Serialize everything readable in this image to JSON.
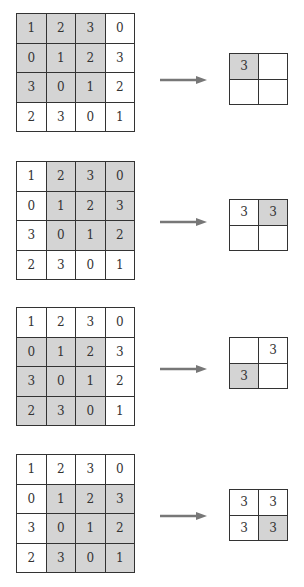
{
  "diagram": {
    "title": "",
    "colors": {
      "highlight": "#d4d4d4",
      "border": "#333333",
      "arrow": "#777777"
    },
    "input": [
      [
        "1",
        "2",
        "3",
        "0"
      ],
      [
        "0",
        "1",
        "2",
        "3"
      ],
      [
        "3",
        "0",
        "1",
        "2"
      ],
      [
        "2",
        "3",
        "0",
        "1"
      ]
    ],
    "steps": [
      {
        "top": 13,
        "out_top": 53,
        "arrow_top": 76,
        "highlight": [
          [
            0,
            0
          ],
          [
            0,
            1
          ],
          [
            0,
            2
          ],
          [
            1,
            0
          ],
          [
            1,
            1
          ],
          [
            1,
            2
          ],
          [
            2,
            0
          ],
          [
            2,
            1
          ],
          [
            2,
            2
          ]
        ],
        "output": [
          [
            "3",
            ""
          ],
          [
            "",
            ""
          ]
        ],
        "output_highlight": [
          [
            0,
            0
          ]
        ]
      },
      {
        "top": 161,
        "out_top": 199,
        "arrow_top": 218,
        "highlight": [
          [
            0,
            1
          ],
          [
            0,
            2
          ],
          [
            0,
            3
          ],
          [
            1,
            1
          ],
          [
            1,
            2
          ],
          [
            1,
            3
          ],
          [
            2,
            1
          ],
          [
            2,
            2
          ],
          [
            2,
            3
          ]
        ],
        "output": [
          [
            "3",
            "3"
          ],
          [
            "",
            ""
          ]
        ],
        "output_highlight": [
          [
            0,
            1
          ]
        ]
      },
      {
        "top": 307,
        "out_top": 337,
        "arrow_top": 365,
        "highlight": [
          [
            1,
            0
          ],
          [
            1,
            1
          ],
          [
            1,
            2
          ],
          [
            2,
            0
          ],
          [
            2,
            1
          ],
          [
            2,
            2
          ],
          [
            3,
            0
          ],
          [
            3,
            1
          ],
          [
            3,
            2
          ]
        ],
        "output": [
          [
            "",
            "3"
          ],
          [
            "3",
            ""
          ]
        ],
        "output_highlight": [
          [
            1,
            0
          ]
        ]
      },
      {
        "top": 454,
        "out_top": 489,
        "arrow_top": 512,
        "highlight": [
          [
            1,
            1
          ],
          [
            1,
            2
          ],
          [
            1,
            3
          ],
          [
            2,
            1
          ],
          [
            2,
            2
          ],
          [
            2,
            3
          ],
          [
            3,
            1
          ],
          [
            3,
            2
          ],
          [
            3,
            3
          ]
        ],
        "output": [
          [
            "3",
            "3"
          ],
          [
            "3",
            "3"
          ]
        ],
        "output_highlight": [
          [
            1,
            1
          ]
        ]
      }
    ]
  }
}
